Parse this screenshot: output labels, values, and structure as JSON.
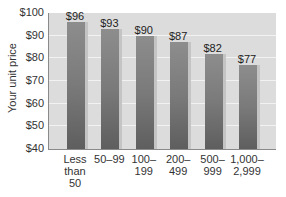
{
  "chart_data": {
    "type": "bar",
    "title": "",
    "xlabel": "",
    "ylabel": "Your unit price",
    "ylim": [
      40,
      100
    ],
    "yticks": [
      "$40",
      "$50",
      "$60",
      "$70",
      "$80",
      "$90",
      "$100"
    ],
    "grid": true,
    "legend": null,
    "categories": [
      "Less than 50",
      "50–99",
      "100–199",
      "200–499",
      "500–999",
      "1,000–2,999"
    ],
    "category_labels_display": [
      "Less\nthan\n50",
      "50–99",
      "100–\n199",
      "200–\n499",
      "500–\n999",
      "1,000–\n2,999"
    ],
    "values": [
      96,
      93,
      90,
      87,
      82,
      77
    ],
    "value_labels": [
      "$96",
      "$93",
      "$90",
      "$87",
      "$82",
      "$77"
    ],
    "colors": {
      "bar": "#7a7a7a",
      "plot_bg": "#dcdcdc",
      "grid": "#f2f2f2"
    }
  }
}
